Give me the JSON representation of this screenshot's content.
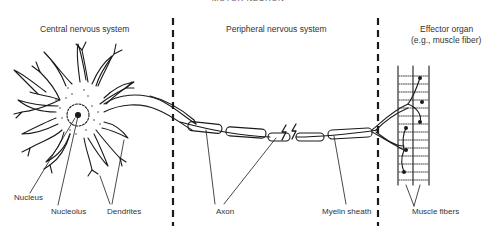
{
  "title": "MOTOR NEURON",
  "sections": [
    {
      "label": "Central nervous system"
    },
    {
      "label": "Peripheral nervous system"
    },
    {
      "label_line1": "Effector organ",
      "label_line2": "(e.g., muscle fiber)"
    }
  ],
  "labels": {
    "nucleus": "Nucleus",
    "nucleolus": "Nucleolus",
    "dendrites": "Dendrites",
    "axon": "Axon",
    "myelin_sheath": "Myelin sheath",
    "muscle_fibers": "Muscle fibers"
  },
  "colors": {
    "ink": "#1a1a1a",
    "text": "#333333",
    "background": "#ffffff"
  }
}
